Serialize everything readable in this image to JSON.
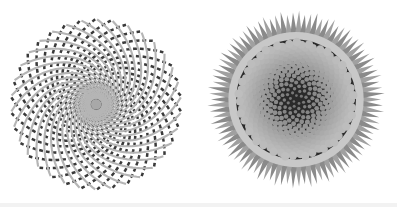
{
  "figures": [
    {
      "name": "spiral-lattice",
      "center": [
        96,
        108
      ],
      "radius": 88,
      "arms": 34,
      "colors": {
        "dark": "#3a3a3a",
        "light": "#b5b5b5",
        "center": "#a8a8a8"
      }
    },
    {
      "name": "sunflower-phyllotaxis",
      "center": [
        99,
        103
      ],
      "radius": 90,
      "florets": 420,
      "golden_angle_deg": 137.508,
      "colors": {
        "floret": "#b9b9b9",
        "edge": "#2a2a2a",
        "petals": "#8a8a8a",
        "ring": "#c8c8c8"
      }
    }
  ]
}
